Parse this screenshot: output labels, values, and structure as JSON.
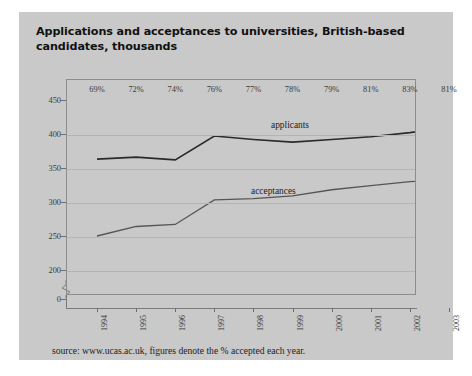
{
  "card": {
    "title": "Applications and acceptances to universities, British-based candidates, thousands",
    "caption": "source: www.ucas.ac.uk, figures denote the % accepted each year."
  },
  "chart_data": {
    "type": "line",
    "title": "Applications and acceptances to universities, British-based candidates, thousands",
    "xlabel": "",
    "ylabel": "thousands",
    "x": [
      "1994",
      "1995",
      "1996",
      "1997",
      "1998",
      "1999",
      "2000",
      "2001",
      "2002",
      "2003"
    ],
    "categories": [
      "1994",
      "1995",
      "1996",
      "1997",
      "1998",
      "1999",
      "2000",
      "2001",
      "2002",
      "2003"
    ],
    "series": [
      {
        "name": "applicants",
        "values": [
          363,
          366,
          362,
          397,
          392,
          388,
          392,
          396,
          402,
          410
        ]
      },
      {
        "name": "acceptances",
        "values": [
          250,
          264,
          267,
          303,
          305,
          309,
          318,
          324,
          330,
          332
        ]
      }
    ],
    "annotations": {
      "name": "percent accepted",
      "values": [
        "69%",
        "72%",
        "74%",
        "76%",
        "77%",
        "78%",
        "79%",
        "81%",
        "83%",
        "81%"
      ]
    },
    "ylim": [
      200,
      450
    ],
    "yticks": [
      450,
      400,
      350,
      300,
      250,
      200,
      0
    ],
    "ytick_labels": [
      "450",
      "400",
      "350",
      "300",
      "250",
      "200",
      "0"
    ],
    "axis_break": true,
    "grid": true,
    "legend": "inline-labels",
    "colors": {
      "applicants": "#2a2a2a",
      "acceptances": "#555555",
      "background": "#c9c9c9",
      "grid": "#b4b4b4",
      "axis": "#7a7a7a"
    }
  }
}
